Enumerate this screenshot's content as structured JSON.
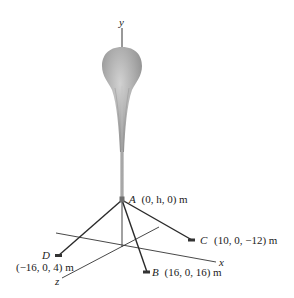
{
  "figure": {
    "axes": {
      "y_label": "y",
      "x_label": "x",
      "z_label": "z"
    },
    "points": {
      "A": {
        "name": "A",
        "coords": "(0, h, 0) m"
      },
      "B": {
        "name": "B",
        "coords": "(16, 0, 16) m"
      },
      "C": {
        "name": "C",
        "coords": "(10, 0, −12) m"
      },
      "D": {
        "name": "D",
        "coords": "(−16, 0, 4) m"
      }
    },
    "colors": {
      "balloon": "#a8a8a8",
      "balloon_highlight": "#d4d4d4",
      "cable": "#2a2a2a",
      "axis": "#333333",
      "tether": "#8a8a8a"
    }
  }
}
